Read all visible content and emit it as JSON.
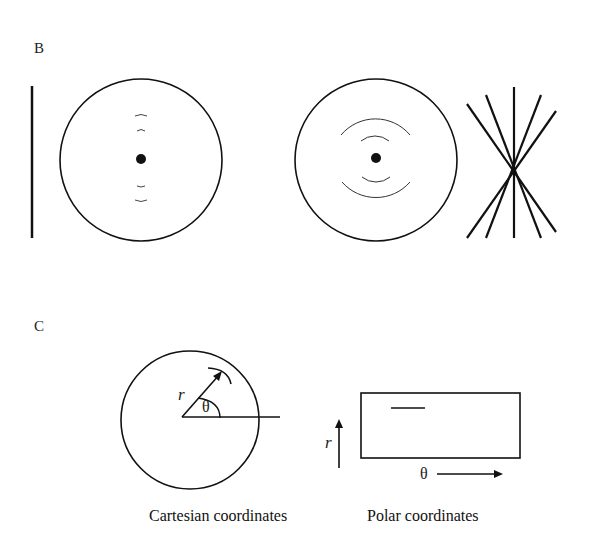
{
  "panels": {
    "B": {
      "label": "B",
      "left_figure": {
        "description": "vertical line beside circle with central dot and small arcs above/below",
        "elements": [
          "vertical-line",
          "circle",
          "center-dot",
          "small-arcs-top",
          "small-arcs-bottom"
        ]
      },
      "right_figure": {
        "description": "circle with central dot and concentric arcs above/below, plus crossed lines intersecting at one point",
        "elements": [
          "circle",
          "center-dot",
          "concentric-arcs-top",
          "concentric-arcs-bottom",
          "crossing-lines"
        ]
      }
    },
    "C": {
      "label": "C",
      "cartesian": {
        "r_label": "r",
        "theta_label": "θ",
        "caption": "Cartesian coordinates"
      },
      "polar": {
        "r_label": "r",
        "theta_label": "θ",
        "caption": "Polar coordinates"
      }
    }
  }
}
